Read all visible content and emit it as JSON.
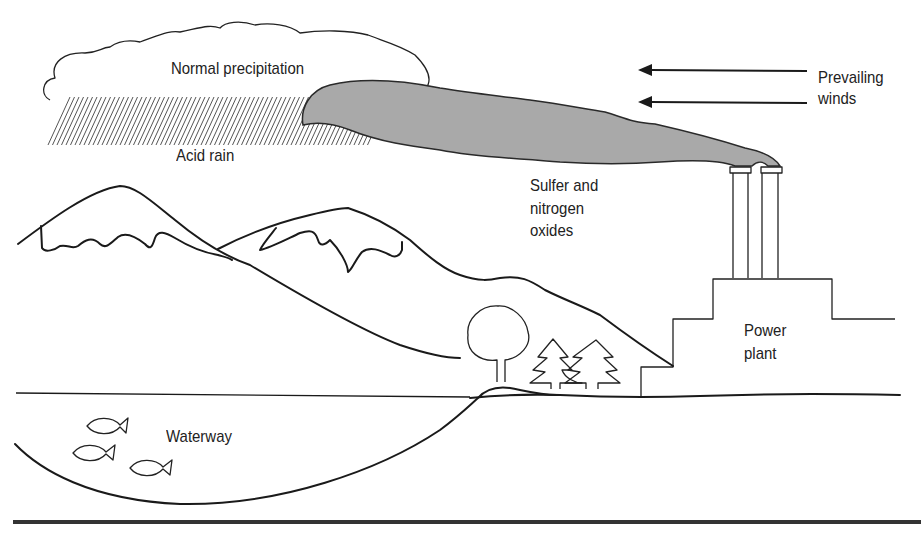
{
  "diagram": {
    "title_fragment": "",
    "labels": {
      "normal_precipitation": "Normal precipitation",
      "acid_rain": "Acid rain",
      "prevailing_winds_line1": "Prevailing",
      "prevailing_winds_line2": "winds",
      "oxides_line1": "Sulfer and",
      "oxides_line2": "nitrogen",
      "oxides_line3": "oxides",
      "power_plant_line1": "Power",
      "power_plant_line2": "plant",
      "waterway": "Waterway"
    },
    "colors": {
      "plume": "#a9a9a9",
      "line": "#1a1a1a",
      "background": "#ffffff"
    },
    "elements": [
      "cloud",
      "acid-rain-hatching",
      "smoke-plume",
      "wind-arrows",
      "smokestacks",
      "power-plant",
      "mountains",
      "deciduous-tree",
      "conifer-trees",
      "waterway",
      "fish",
      "ground-line"
    ]
  }
}
